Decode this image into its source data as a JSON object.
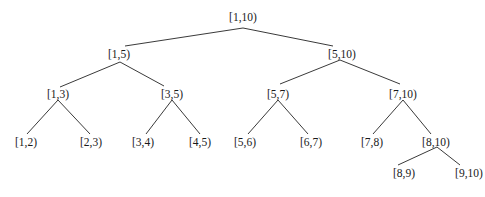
{
  "diagram": {
    "type": "segment-tree",
    "nodes": [
      {
        "id": "n1_10",
        "label": "[1,10)",
        "x": 243,
        "y": 17
      },
      {
        "id": "n1_5",
        "label": "[1,5)",
        "x": 119,
        "y": 54
      },
      {
        "id": "n5_10",
        "label": "[5,10)",
        "x": 342,
        "y": 54
      },
      {
        "id": "n1_3",
        "label": "[1,3)",
        "x": 58,
        "y": 94
      },
      {
        "id": "n3_5",
        "label": "[3,5)",
        "x": 172,
        "y": 94
      },
      {
        "id": "n5_7",
        "label": "[5,7)",
        "x": 278,
        "y": 94
      },
      {
        "id": "n7_10",
        "label": "[7,10)",
        "x": 403,
        "y": 94
      },
      {
        "id": "n1_2",
        "label": "[1,2)",
        "x": 26,
        "y": 142
      },
      {
        "id": "n2_3",
        "label": "[2,3)",
        "x": 91,
        "y": 142
      },
      {
        "id": "n3_4",
        "label": "[3,4)",
        "x": 143,
        "y": 142
      },
      {
        "id": "n4_5",
        "label": "[4,5)",
        "x": 200,
        "y": 142
      },
      {
        "id": "n5_6",
        "label": "[5,6)",
        "x": 245,
        "y": 142
      },
      {
        "id": "n6_7",
        "label": "[6,7)",
        "x": 311,
        "y": 142
      },
      {
        "id": "n7_8",
        "label": "[7,8)",
        "x": 372,
        "y": 142
      },
      {
        "id": "n8_10",
        "label": "[8,10)",
        "x": 436,
        "y": 142
      },
      {
        "id": "n8_9",
        "label": "[8,9)",
        "x": 404,
        "y": 173
      },
      {
        "id": "n9_10",
        "label": "[9,10)",
        "x": 469,
        "y": 173
      }
    ],
    "edges": [
      {
        "from": "n1_10",
        "to": "n1_5",
        "x1": 243,
        "y1": 28,
        "x2": 125,
        "y2": 46
      },
      {
        "from": "n1_10",
        "to": "n5_10",
        "x1": 243,
        "y1": 28,
        "x2": 333,
        "y2": 46
      },
      {
        "from": "n1_5",
        "to": "n1_3",
        "x1": 120,
        "y1": 62,
        "x2": 60,
        "y2": 87
      },
      {
        "from": "n1_5",
        "to": "n3_5",
        "x1": 120,
        "y1": 62,
        "x2": 164,
        "y2": 86
      },
      {
        "from": "n5_10",
        "to": "n5_7",
        "x1": 340,
        "y1": 60,
        "x2": 280,
        "y2": 84
      },
      {
        "from": "n5_10",
        "to": "n7_10",
        "x1": 340,
        "y1": 60,
        "x2": 400,
        "y2": 84
      },
      {
        "from": "n1_3",
        "to": "n1_2",
        "x1": 58,
        "y1": 100,
        "x2": 27,
        "y2": 134
      },
      {
        "from": "n1_3",
        "to": "n2_3",
        "x1": 58,
        "y1": 100,
        "x2": 90,
        "y2": 134
      },
      {
        "from": "n3_5",
        "to": "n3_4",
        "x1": 172,
        "y1": 100,
        "x2": 146,
        "y2": 134
      },
      {
        "from": "n3_5",
        "to": "n4_5",
        "x1": 172,
        "y1": 100,
        "x2": 200,
        "y2": 134
      },
      {
        "from": "n5_7",
        "to": "n5_6",
        "x1": 278,
        "y1": 100,
        "x2": 248,
        "y2": 134
      },
      {
        "from": "n5_7",
        "to": "n6_7",
        "x1": 278,
        "y1": 100,
        "x2": 308,
        "y2": 134
      },
      {
        "from": "n7_10",
        "to": "n7_8",
        "x1": 403,
        "y1": 100,
        "x2": 373,
        "y2": 134
      },
      {
        "from": "n7_10",
        "to": "n8_10",
        "x1": 403,
        "y1": 100,
        "x2": 431,
        "y2": 134
      },
      {
        "from": "n8_10",
        "to": "n8_9",
        "x1": 437,
        "y1": 147,
        "x2": 398,
        "y2": 165
      },
      {
        "from": "n8_10",
        "to": "n9_10",
        "x1": 437,
        "y1": 147,
        "x2": 460,
        "y2": 165
      }
    ]
  }
}
